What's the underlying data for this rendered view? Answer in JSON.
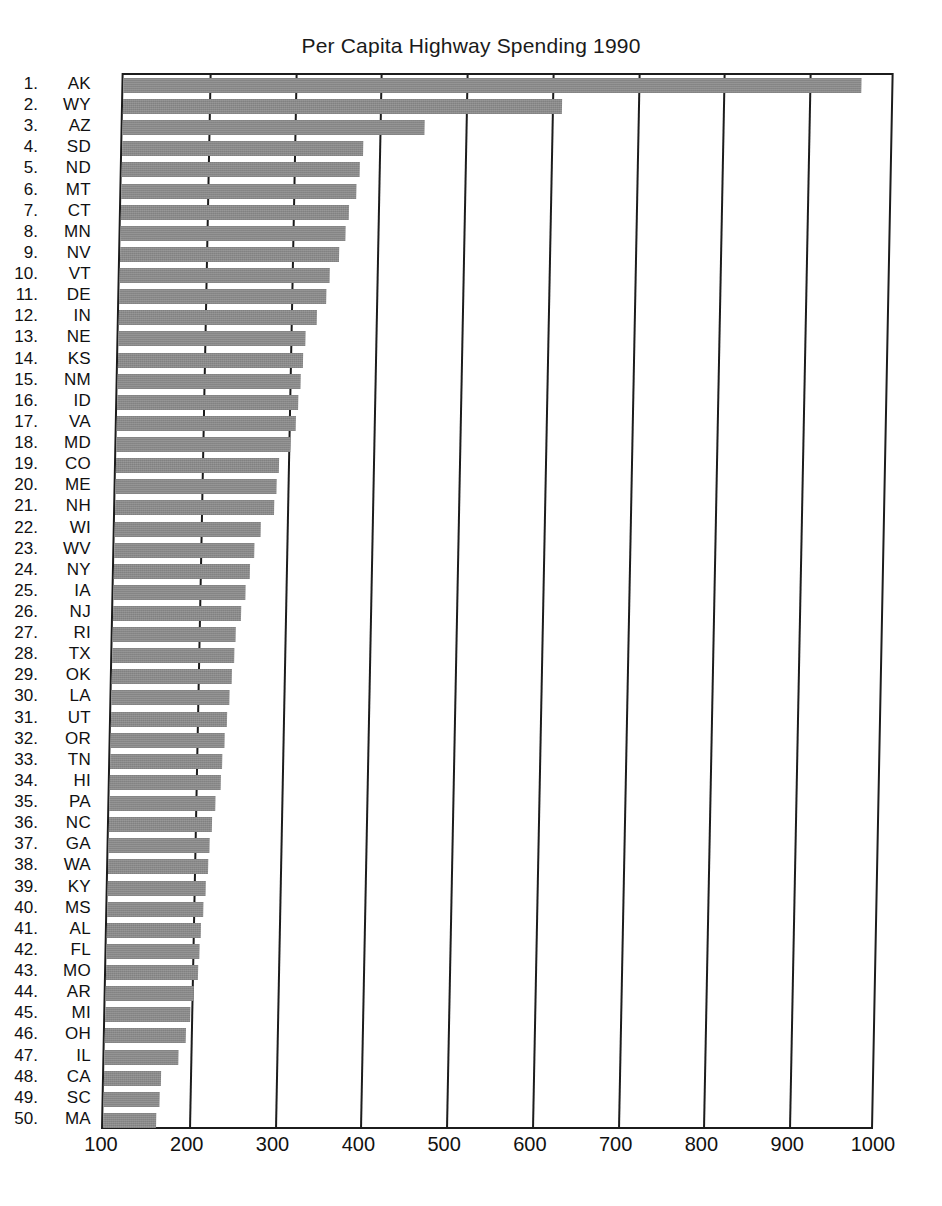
{
  "chart_data": {
    "type": "bar",
    "orientation": "horizontal",
    "title": "Per Capita Highway Spending 1990",
    "xlabel": "",
    "ylabel": "",
    "xlim": [
      100,
      1000
    ],
    "xticks": [
      100,
      200,
      300,
      400,
      500,
      600,
      700,
      800,
      900,
      1000
    ],
    "grid": true,
    "legend": null,
    "bar_color": "#8a8a8a",
    "axis_color": "#1c1c1c",
    "categories": [
      "AK",
      "WY",
      "AZ",
      "SD",
      "ND",
      "MT",
      "CT",
      "MN",
      "NV",
      "VT",
      "DE",
      "IN",
      "NE",
      "KS",
      "NM",
      "ID",
      "VA",
      "MD",
      "CO",
      "ME",
      "NH",
      "WI",
      "WV",
      "NY",
      "IA",
      "NJ",
      "RI",
      "TX",
      "OK",
      "LA",
      "UT",
      "OR",
      "TN",
      "HI",
      "PA",
      "NC",
      "GA",
      "WA",
      "KY",
      "MS",
      "AL",
      "FL",
      "MO",
      "AR",
      "MI",
      "OH",
      "IL",
      "CA",
      "SC",
      "MA"
    ],
    "values": [
      960,
      612,
      452,
      381,
      378,
      374,
      366,
      362,
      355,
      345,
      341,
      331,
      318,
      316,
      313,
      311,
      309,
      303,
      290,
      288,
      285,
      270,
      263,
      259,
      254,
      249,
      243,
      242,
      240,
      237,
      235,
      233,
      231,
      229,
      223,
      220,
      218,
      216,
      214,
      212,
      210,
      208,
      207,
      203,
      199,
      194,
      186,
      167,
      165,
      162
    ],
    "rows": [
      {
        "rank": "1.",
        "state": "AK",
        "value": 960
      },
      {
        "rank": "2.",
        "state": "WY",
        "value": 612
      },
      {
        "rank": "3.",
        "state": "AZ",
        "value": 452
      },
      {
        "rank": "4.",
        "state": "SD",
        "value": 381
      },
      {
        "rank": "5.",
        "state": "ND",
        "value": 378
      },
      {
        "rank": "6.",
        "state": "MT",
        "value": 374
      },
      {
        "rank": "7.",
        "state": "CT",
        "value": 366
      },
      {
        "rank": "8.",
        "state": "MN",
        "value": 362
      },
      {
        "rank": "9.",
        "state": "NV",
        "value": 355
      },
      {
        "rank": "10.",
        "state": "VT",
        "value": 345
      },
      {
        "rank": "11.",
        "state": "DE",
        "value": 341
      },
      {
        "rank": "12.",
        "state": "IN",
        "value": 331
      },
      {
        "rank": "13.",
        "state": "NE",
        "value": 318
      },
      {
        "rank": "14.",
        "state": "KS",
        "value": 316
      },
      {
        "rank": "15.",
        "state": "NM",
        "value": 313
      },
      {
        "rank": "16.",
        "state": "ID",
        "value": 311
      },
      {
        "rank": "17.",
        "state": "VA",
        "value": 309
      },
      {
        "rank": "18.",
        "state": "MD",
        "value": 303
      },
      {
        "rank": "19.",
        "state": "CO",
        "value": 290
      },
      {
        "rank": "20.",
        "state": "ME",
        "value": 288
      },
      {
        "rank": "21.",
        "state": "NH",
        "value": 285
      },
      {
        "rank": "22.",
        "state": "WI",
        "value": 270
      },
      {
        "rank": "23.",
        "state": "WV",
        "value": 263
      },
      {
        "rank": "24.",
        "state": "NY",
        "value": 259
      },
      {
        "rank": "25.",
        "state": "IA",
        "value": 254
      },
      {
        "rank": "26.",
        "state": "NJ",
        "value": 249
      },
      {
        "rank": "27.",
        "state": "RI",
        "value": 243
      },
      {
        "rank": "28.",
        "state": "TX",
        "value": 242
      },
      {
        "rank": "29.",
        "state": "OK",
        "value": 240
      },
      {
        "rank": "30.",
        "state": "LA",
        "value": 237
      },
      {
        "rank": "31.",
        "state": "UT",
        "value": 235
      },
      {
        "rank": "32.",
        "state": "OR",
        "value": 233
      },
      {
        "rank": "33.",
        "state": "TN",
        "value": 231
      },
      {
        "rank": "34.",
        "state": "HI",
        "value": 229
      },
      {
        "rank": "35.",
        "state": "PA",
        "value": 223
      },
      {
        "rank": "36.",
        "state": "NC",
        "value": 220
      },
      {
        "rank": "37.",
        "state": "GA",
        "value": 218
      },
      {
        "rank": "38.",
        "state": "WA",
        "value": 216
      },
      {
        "rank": "39.",
        "state": "KY",
        "value": 214
      },
      {
        "rank": "40.",
        "state": "MS",
        "value": 212
      },
      {
        "rank": "41.",
        "state": "AL",
        "value": 210
      },
      {
        "rank": "42.",
        "state": "FL",
        "value": 208
      },
      {
        "rank": "43.",
        "state": "MO",
        "value": 207
      },
      {
        "rank": "44.",
        "state": "AR",
        "value": 203
      },
      {
        "rank": "45.",
        "state": "MI",
        "value": 199
      },
      {
        "rank": "46.",
        "state": "OH",
        "value": 194
      },
      {
        "rank": "47.",
        "state": "IL",
        "value": 186
      },
      {
        "rank": "48.",
        "state": "CA",
        "value": 167
      },
      {
        "rank": "49.",
        "state": "SC",
        "value": 165
      },
      {
        "rank": "50.",
        "state": "MA",
        "value": 162
      }
    ]
  }
}
